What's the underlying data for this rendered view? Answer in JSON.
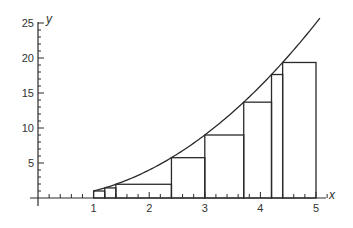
{
  "chart_data": {
    "type": "line",
    "title": "",
    "xlabel": "x",
    "ylabel": "y",
    "curve": {
      "name": "y = x^2",
      "function": "x^2",
      "x_range": [
        1,
        5
      ]
    },
    "xlim": [
      0,
      5.3
    ],
    "ylim": [
      0,
      26
    ],
    "x_ticks": [
      1,
      2,
      3,
      4,
      5
    ],
    "x_tick_labels": [
      "1",
      "2",
      "3",
      "4",
      "5"
    ],
    "y_ticks": [
      5,
      10,
      15,
      20,
      25
    ],
    "y_tick_labels": [
      "5",
      "10",
      "15",
      "20",
      "25"
    ],
    "x_minor_step": 0.2,
    "y_minor_step": 1,
    "grid": false,
    "legend": "none",
    "rectangles": [
      {
        "x0": 1.0,
        "x1": 1.2,
        "height": 1.0
      },
      {
        "x0": 1.2,
        "x1": 1.4,
        "height": 1.44
      },
      {
        "x0": 1.4,
        "x1": 2.4,
        "height": 1.96
      },
      {
        "x0": 2.4,
        "x1": 3.0,
        "height": 5.76
      },
      {
        "x0": 3.0,
        "x1": 3.7,
        "height": 9.0
      },
      {
        "x0": 3.7,
        "x1": 4.2,
        "height": 13.69
      },
      {
        "x0": 4.2,
        "x1": 4.4,
        "height": 17.64
      },
      {
        "x0": 4.4,
        "x1": 5.0,
        "height": 19.36
      }
    ],
    "colors": {
      "stroke": "#2a2a2a",
      "text": "#333333",
      "background": "#ffffff"
    }
  }
}
